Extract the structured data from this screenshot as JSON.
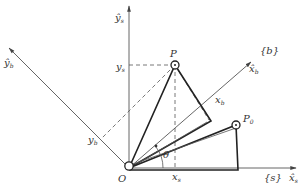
{
  "diagram": {
    "labels": {
      "y_s_hat": "ŷ",
      "y_s_hat_sub": "s",
      "x_s_hat": "x̂",
      "x_s_hat_sub": "s",
      "x_b_hat": "x̂",
      "x_b_hat_sub": "b",
      "y_b_hat": "ŷ",
      "y_b_hat_sub": "b",
      "frame_b": "{b}",
      "frame_s": "{s}",
      "origin": "O",
      "point_p": "P",
      "point_p0": "P",
      "point_p0_sub": "0",
      "y_s_coord": "y",
      "y_s_coord_sub": "s",
      "x_s_coord": "x",
      "x_s_coord_sub": "s",
      "x_b_coord": "x",
      "x_b_coord_sub": "b",
      "y_b_coord": "y",
      "y_b_coord_sub": "b",
      "angle": "θ"
    },
    "colors": {
      "line": "#222222",
      "axis": "#555555",
      "text": "#333333"
    }
  }
}
